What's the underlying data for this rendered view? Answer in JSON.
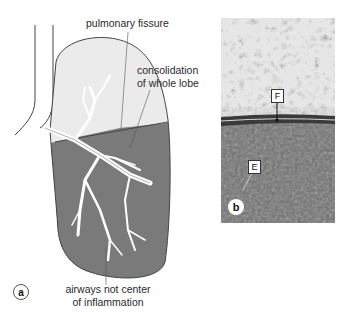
{
  "panel_a": {
    "marker": "a",
    "labels": {
      "pulmonary_fissure": "pulmonary fissure",
      "consolidation_line1": "consolidation",
      "consolidation_line2": "of whole lobe",
      "airways_line1": "airways not center",
      "airways_line2": "of inflammation"
    },
    "colors": {
      "upper_lobe": "#ebebeb",
      "lower_lobe": "#7a7a7a",
      "outline": "#444444",
      "airway": "#ffffff"
    }
  },
  "panel_b": {
    "marker": "b",
    "labels": {
      "fissure": "F",
      "exudate": "E"
    },
    "colors": {
      "normal_lung": "#d9d9d9",
      "fissure_band": "#3a3a3a",
      "consolidated": "#6e6e6e"
    }
  }
}
